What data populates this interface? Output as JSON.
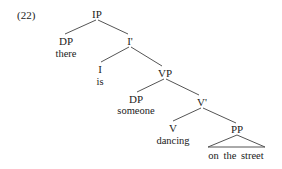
{
  "example_number": "(22)",
  "tree": {
    "nodes": {
      "ip": {
        "label": "IP"
      },
      "dp1": {
        "label": "DP",
        "word": "there"
      },
      "ibar": {
        "label": "I'"
      },
      "i": {
        "label": "I",
        "word": "is"
      },
      "vp": {
        "label": "VP"
      },
      "dp2": {
        "label": "DP",
        "word": "someone"
      },
      "vbar": {
        "label": "V'"
      },
      "v": {
        "label": "V",
        "word": "dancing"
      },
      "pp": {
        "label": "PP",
        "word": "on the street",
        "triangle": true
      }
    },
    "edges": [
      [
        "ip",
        "dp1"
      ],
      [
        "ip",
        "ibar"
      ],
      [
        "ibar",
        "i"
      ],
      [
        "ibar",
        "vp"
      ],
      [
        "vp",
        "dp2"
      ],
      [
        "vp",
        "vbar"
      ],
      [
        "vbar",
        "v"
      ],
      [
        "vbar",
        "pp"
      ]
    ]
  },
  "colors": {
    "line": "#555555",
    "text": "#222222"
  }
}
